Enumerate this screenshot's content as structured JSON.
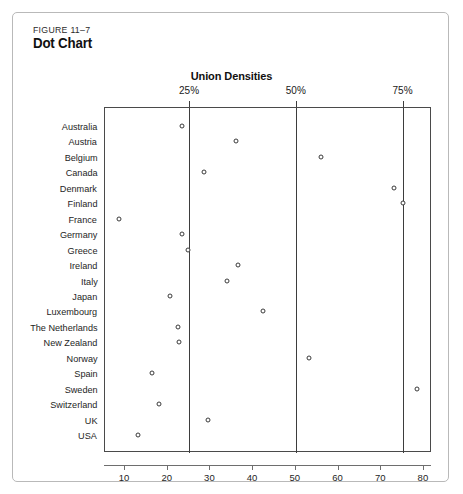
{
  "figure": {
    "number": "FIGURE 11–7",
    "title": "Dot Chart"
  },
  "chart_data": {
    "type": "scatter",
    "title": "Union Densities",
    "xlabel": "",
    "ylabel": "",
    "xlim": [
      6.5,
      83
    ],
    "grid": true,
    "legend": "none",
    "gridline_labels": [
      "25%",
      "50%",
      "75%"
    ],
    "gridline_values": [
      25,
      50,
      75
    ],
    "axis_ticks": [
      "10",
      "20",
      "30",
      "40",
      "50",
      "60",
      "70",
      "80"
    ],
    "axis_tick_values": [
      10,
      20,
      30,
      40,
      50,
      60,
      70,
      80
    ],
    "categories": [
      "Australia",
      "Austria",
      "Belgium",
      "Canada",
      "Denmark",
      "Finland",
      "France",
      "Germany",
      "Greece",
      "Ireland",
      "Italy",
      "Japan",
      "Luxembourg",
      "The Netherlands",
      "New Zealand",
      "Norway",
      "Spain",
      "Sweden",
      "Switzerland",
      "UK",
      "USA"
    ],
    "values": [
      23.3,
      36.0,
      56.0,
      28.5,
      73.0,
      75.0,
      8.6,
      23.3,
      24.7,
      36.4,
      34.0,
      20.5,
      42.4,
      22.5,
      22.6,
      53.2,
      16.3,
      78.4,
      18.0,
      29.4,
      13.0
    ],
    "colors": {
      "marker_stroke": "#3a3a3a",
      "marker_fill": "#ffffff",
      "frame": "#4a4a4a",
      "gridline": "#3d3d3d",
      "axis": "#6e6e6e"
    }
  }
}
